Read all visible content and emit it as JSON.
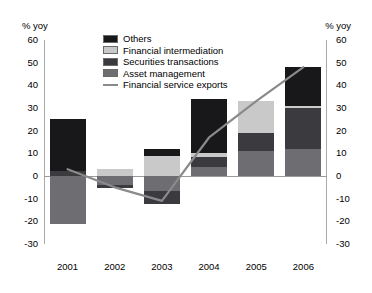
{
  "axis": {
    "unit_left": "% yoy",
    "unit_right": "% yoy",
    "ticks": [
      "60",
      "50",
      "40",
      "30",
      "20",
      "10",
      "0",
      "-10",
      "-20",
      "-30"
    ]
  },
  "legend": {
    "items": [
      {
        "label": "Others",
        "type": "swatch",
        "color": "#18181a",
        "icon": "legend-swatch-others"
      },
      {
        "label": "Financial intermediation",
        "type": "swatch",
        "color": "#c9c9c9",
        "icon": "legend-swatch-financial-intermediation"
      },
      {
        "label": "Securities transactions",
        "type": "swatch",
        "color": "#3b3b3f",
        "icon": "legend-swatch-securities-transactions"
      },
      {
        "label": "Asset management",
        "type": "swatch",
        "color": "#6e6e72",
        "icon": "legend-swatch-asset-management"
      },
      {
        "label": "Financial service exports",
        "type": "line",
        "color": "#8a8a8a",
        "icon": "legend-line-financial-service-exports"
      }
    ]
  },
  "chart_data": {
    "type": "bar",
    "title": "",
    "xlabel": "",
    "ylabel": "% yoy",
    "ylim": [
      -30,
      60
    ],
    "ytick_step": 10,
    "grid": false,
    "stacked": true,
    "legend_position": "top-center",
    "categories": [
      "2001",
      "2002",
      "2003",
      "2004",
      "2005",
      "2006"
    ],
    "series": [
      {
        "name": "Asset management",
        "color": "#6e6e72",
        "values": [
          -21.0,
          -4.0,
          -6.5,
          4.0,
          11.0,
          12.0
        ]
      },
      {
        "name": "Securities transactions",
        "color": "#3b3b3f",
        "values": [
          2.0,
          -1.5,
          -6.0,
          4.5,
          8.0,
          18.0
        ]
      },
      {
        "name": "Financial intermediation",
        "color": "#c9c9c9",
        "values": [
          0.0,
          3.0,
          9.0,
          1.5,
          14.0,
          1.0
        ]
      },
      {
        "name": "Others",
        "color": "#18181a",
        "values": [
          23.0,
          0.0,
          3.0,
          24.0,
          0.0,
          17.0
        ]
      }
    ],
    "overlay_line": {
      "name": "Financial service exports",
      "color": "#8a8a8a",
      "values": [
        3.0,
        -5.0,
        -11.0,
        17.0,
        33.0,
        48.0
      ]
    }
  }
}
